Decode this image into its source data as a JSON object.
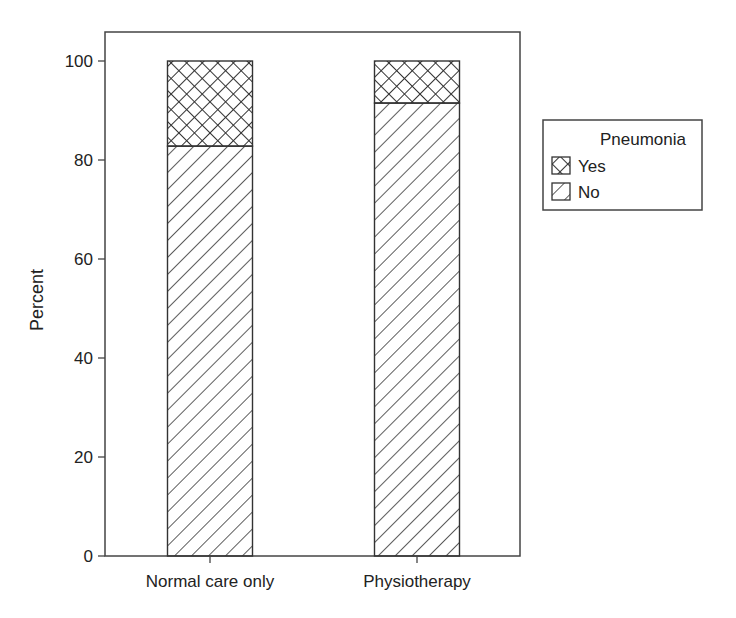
{
  "chart_data": {
    "type": "bar",
    "stacked": true,
    "percent": true,
    "title": "",
    "xlabel": "",
    "ylabel": "Percent",
    "ylim": [
      0,
      100
    ],
    "yticks": [
      0,
      20,
      40,
      60,
      80,
      100
    ],
    "categories": [
      "Normal care only",
      "Physiotherapy"
    ],
    "series": [
      {
        "name": "No",
        "values": [
          82.8,
          91.5
        ],
        "pattern": "diagonal-hatch"
      },
      {
        "name": "Yes",
        "values": [
          17.2,
          8.5
        ],
        "pattern": "cross-hatch"
      }
    ],
    "legend": {
      "title": "Pneumonia",
      "position": "right",
      "entries": [
        {
          "label": "Yes",
          "pattern": "cross-hatch"
        },
        {
          "label": "No",
          "pattern": "diagonal-hatch"
        }
      ]
    },
    "grid": false
  },
  "colors": {
    "line": "#444444",
    "hatch": "#333333",
    "background": "#ffffff"
  }
}
